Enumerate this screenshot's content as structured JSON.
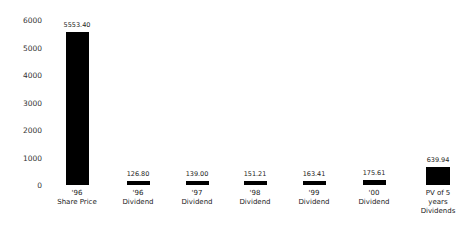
{
  "chart_data": {
    "type": "bar",
    "title": "",
    "xlabel": "",
    "ylabel": "",
    "ylim": [
      0,
      6000
    ],
    "yticks": [
      "6000",
      "5000",
      "4000",
      "3000",
      "2000",
      "1000",
      "0"
    ],
    "grid": false,
    "legend": null,
    "categories": [
      "'96 Share Price",
      "'96 Dividend",
      "'97 Dividend",
      "'98 Dividend",
      "'99 Dividend",
      "'00 Dividend",
      "PV of 5 years Dividends"
    ],
    "category_lines": [
      [
        "'96",
        "Share Price"
      ],
      [
        "'96",
        "Dividend"
      ],
      [
        "'97",
        "Dividend"
      ],
      [
        "'98",
        "Dividend"
      ],
      [
        "'99",
        "Dividend"
      ],
      [
        "'00",
        "Dividend"
      ],
      [
        "PV of 5",
        "years",
        "Dividends"
      ]
    ],
    "values": [
      5553.4,
      126.8,
      139.0,
      151.21,
      163.41,
      175.61,
      639.94
    ],
    "value_labels": [
      "5553.40",
      "126.80",
      "139.00",
      "151.21",
      "163.41",
      "175.61",
      "639.94"
    ],
    "bar_color": "#000000"
  }
}
